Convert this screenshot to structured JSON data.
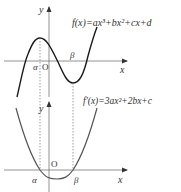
{
  "top_graph": {
    "function_label": "f(x)=ax³+bx²+cx+d",
    "axis_x_label": "x",
    "axis_y_label": "y",
    "origin_label": "O",
    "alpha_label": "α",
    "beta_label": "β",
    "description": "Cubic with local maximum at x=α (left of origin) and local minimum at x=β (right of origin)"
  },
  "bottom_graph": {
    "function_label": "f′(x)=3ax²+2bx+c",
    "axis_x_label": "x",
    "axis_y_label": "y",
    "origin_label": "O",
    "alpha_label": "α",
    "beta_label": "β",
    "description": "Upward parabola crossing the x-axis at α and β"
  },
  "colors": {
    "curve": "#1a1a1a",
    "parabola": "#555555",
    "axis": "#666666",
    "text": "#333333",
    "dotted": "#777777"
  }
}
